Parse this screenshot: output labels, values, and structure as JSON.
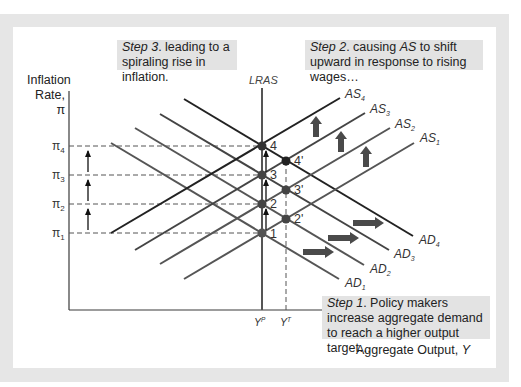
{
  "notes": {
    "step3": {
      "step": "Step 3",
      "text": ". leading to a spiraling rise in inflation."
    },
    "step2": {
      "step": "Step 2",
      "text_a": ". causing ",
      "italic": "AS",
      "text_b": " to shift upward in response to rising wages…"
    },
    "step1": {
      "step": "Step 1",
      "text": ". Policy makers increase aggregate demand to reach a higher output target…"
    }
  },
  "axes": {
    "y_label_line1": "Inflation",
    "y_label_line2": "Rate, π",
    "x_label": "Aggregate Output, ",
    "x_label_var": "Y",
    "lras_label": "LRAS",
    "x_ticks": [
      {
        "base": "Y",
        "sup": "P"
      },
      {
        "base": "Y",
        "sup": "T"
      }
    ],
    "y_ticks": [
      {
        "base": "π",
        "sub": "4"
      },
      {
        "base": "π",
        "sub": "3"
      },
      {
        "base": "π",
        "sub": "2"
      },
      {
        "base": "π",
        "sub": "1"
      }
    ]
  },
  "curves": {
    "AS": [
      {
        "base": "AS",
        "sub": "4"
      },
      {
        "base": "AS",
        "sub": "3"
      },
      {
        "base": "AS",
        "sub": "2"
      },
      {
        "base": "AS",
        "sub": "1"
      }
    ],
    "AD": [
      {
        "base": "AD",
        "sub": "4"
      },
      {
        "base": "AD",
        "sub": "3"
      },
      {
        "base": "AD",
        "sub": "2"
      },
      {
        "base": "AD",
        "sub": "1"
      }
    ]
  },
  "points": {
    "lras": [
      "4",
      "3",
      "2",
      "1"
    ],
    "target": [
      "4'",
      "3'",
      "2'"
    ]
  },
  "colors": {
    "line": "#3a3a3a",
    "dot": "#444444",
    "fat_arrow": "#4a4a4a",
    "note_bg": "#e3e3e3",
    "frame": "#e6e6e6"
  }
}
